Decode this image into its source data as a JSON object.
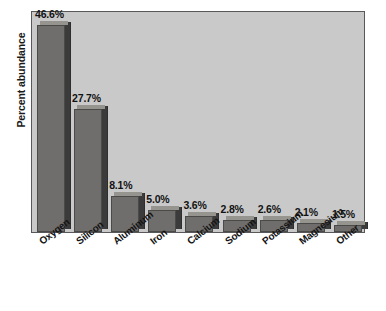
{
  "chart_data": {
    "type": "bar",
    "title": "",
    "xlabel": "",
    "ylabel": "Percent abundance",
    "ylim": [
      0,
      50
    ],
    "grid": false,
    "legend": "none",
    "categories": [
      "Oxygen",
      "Silicon",
      "Aluminum",
      "Iron",
      "Calcium",
      "Sodium",
      "Potassium",
      "Magnesium",
      "Other"
    ],
    "values": [
      46.6,
      27.7,
      8.1,
      5.0,
      3.6,
      2.8,
      2.6,
      2.1,
      1.5
    ],
    "value_labels": [
      "46.6%",
      "27.7%",
      "8.1%",
      "5.0%",
      "3.6%",
      "2.8%",
      "2.6%",
      "2.1%",
      "1.5%"
    ]
  },
  "colors": {
    "plot_background": "#c9c9c9",
    "plot_border": "#58585a",
    "bar_face": "#6f6e6c",
    "bar_side": "#3c3b3b",
    "bar_top": "#96948f",
    "text": "#141414",
    "page_background": "#ffffff"
  }
}
